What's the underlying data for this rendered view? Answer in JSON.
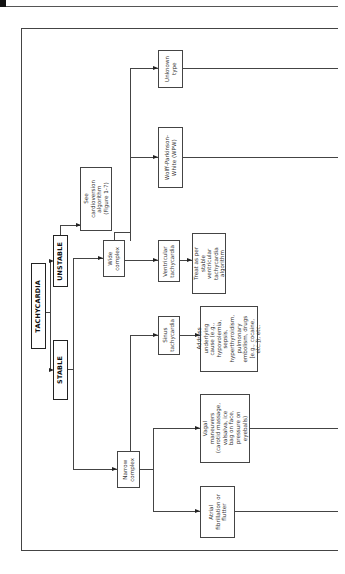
{
  "diagram": {
    "orientation": "rotated-90-ccw",
    "root": "TACHYCARDIA",
    "nodes": {
      "tachycardia": "TACHYCARDIA",
      "stable": "STABLE",
      "unstable": "UNSTABLE",
      "cardioversion": "See\ncardioversion\nalgorithm\n(Figure 1-7)",
      "wide_complex": "Wide\ncomplex",
      "narrow_complex": "Narrow\ncomplex",
      "ventricular_tachycardia": "Ventricular\ntachycardia",
      "treat_as_per": "Treat as per\nstable\nventricular\ntachycardia\nalgorithm",
      "wpw": "Wolff-Parkinson-\nWhite (WPW)",
      "unknown_type": "Unknown\ntype",
      "sinus_tachycardia": "Sinus\ntachycardia",
      "address_cause": "Address\nunderlying\ncause (e.g.,\nhypovolemia,\nsepsis,\nhyperthyroidism,\npulmonary\nembolism, drugs\n[e.g., cocaine,\netc.]), etc.",
      "vagal_maneuvers": "Vagal\nmaneuvers\n(carotid massage,\nvalsalva, ice\nbag on face,\npressure on\neyeballs)",
      "atrial_fib": "Atrial\nfibrillation or\nflutter"
    },
    "edges": [
      [
        "tachycardia",
        "stable"
      ],
      [
        "tachycardia",
        "unstable"
      ],
      [
        "unstable",
        "cardioversion"
      ],
      [
        "stable",
        "wide_complex"
      ],
      [
        "stable",
        "narrow_complex"
      ],
      [
        "wide_complex",
        "ventricular_tachycardia"
      ],
      [
        "ventricular_tachycardia",
        "treat_as_per"
      ],
      [
        "wide_complex",
        "wpw"
      ],
      [
        "wide_complex",
        "unknown_type"
      ],
      [
        "narrow_complex",
        "sinus_tachycardia"
      ],
      [
        "sinus_tachycardia",
        "address_cause"
      ],
      [
        "narrow_complex",
        "vagal_maneuvers"
      ],
      [
        "narrow_complex",
        "atrial_fib"
      ]
    ]
  }
}
